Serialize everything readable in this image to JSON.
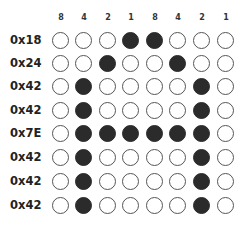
{
  "column_headers": [
    "8",
    "4",
    "2",
    "1",
    "8",
    "4",
    "2",
    "1"
  ],
  "rows": [
    {
      "label": "0x18",
      "bits": [
        0,
        0,
        0,
        1,
        1,
        0,
        0,
        0
      ]
    },
    {
      "label": "0x24",
      "bits": [
        0,
        0,
        1,
        0,
        0,
        1,
        0,
        0
      ]
    },
    {
      "label": "0x42",
      "bits": [
        0,
        1,
        0,
        0,
        0,
        0,
        1,
        0
      ]
    },
    {
      "label": "0x42",
      "bits": [
        0,
        1,
        0,
        0,
        0,
        0,
        1,
        0
      ]
    },
    {
      "label": "0x7E",
      "bits": [
        0,
        1,
        1,
        1,
        1,
        1,
        1,
        0
      ]
    },
    {
      "label": "0x42",
      "bits": [
        0,
        1,
        0,
        0,
        0,
        0,
        1,
        0
      ]
    },
    {
      "label": "0x42",
      "bits": [
        0,
        1,
        0,
        0,
        0,
        0,
        1,
        0
      ]
    },
    {
      "label": "0x42",
      "bits": [
        0,
        1,
        0,
        0,
        0,
        0,
        1,
        0
      ]
    }
  ],
  "colors": {
    "on": "#2b2b2b",
    "off": "#ffffff",
    "outline": "#555555"
  }
}
